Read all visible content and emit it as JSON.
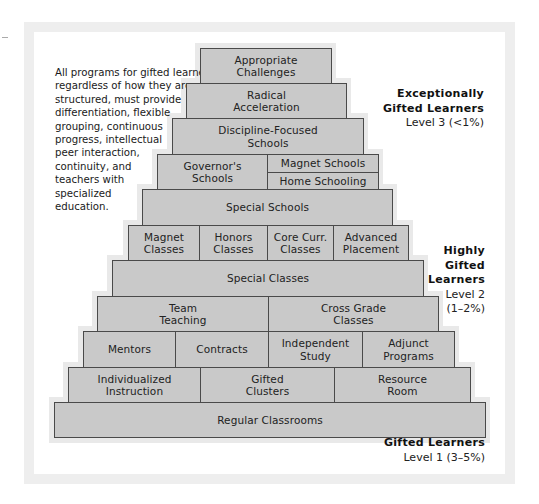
{
  "diagram": {
    "type": "pyramid",
    "note_lines": [
      "All programs for gifted learners,",
      "regardless of how they are",
      "structured, must provide",
      "differentiation, flexible",
      "grouping, continuous",
      "progress, intellectual",
      "peer interaction,",
      "continuity, and",
      "teachers with",
      "specialized",
      "education."
    ],
    "rows": [
      {
        "cells": [
          "Appropriate\nChallenges"
        ]
      },
      {
        "cells": [
          "Radical\nAcceleration"
        ]
      },
      {
        "cells": [
          "Discipline-Focused\nSchools"
        ]
      },
      {
        "cells": [
          "Governor's\nSchools",
          "Magnet Schools",
          "Home Schooling"
        ]
      },
      {
        "cells": [
          "Special Schools"
        ]
      },
      {
        "cells": [
          "Magnet\nClasses",
          "Honors\nClasses",
          "Core Curr.\nClasses",
          "Advanced\nPlacement"
        ]
      },
      {
        "cells": [
          "Special Classes"
        ]
      },
      {
        "cells": [
          "Team\nTeaching",
          "Cross Grade\nClasses"
        ]
      },
      {
        "cells": [
          "Mentors",
          "Contracts",
          "Independent\nStudy",
          "Adjunct\nPrograms"
        ]
      },
      {
        "cells": [
          "Individualized\nInstruction",
          "Gifted\nClusters",
          "Resource\nRoom"
        ]
      },
      {
        "cells": [
          "Regular Classrooms"
        ]
      }
    ],
    "levels": {
      "level3": {
        "title_lines": [
          "Exceptionally",
          "Gifted Learners"
        ],
        "sub_lines": [
          "Level 3 (<1%)"
        ]
      },
      "level2": {
        "title_lines": [
          "Highly",
          "Gifted",
          "Learners"
        ],
        "sub_lines": [
          "Level 2",
          "(1–2%)"
        ]
      },
      "level1": {
        "title_lines": [
          "Gifted Learners"
        ],
        "sub_lines": [
          "Level 1 (3–5%)"
        ]
      }
    },
    "colors": {
      "box_fill": "#c9c9c9",
      "box_border": "#4a4a4a",
      "halo": "#e9e9e9",
      "frame": "#eeeeee"
    }
  }
}
